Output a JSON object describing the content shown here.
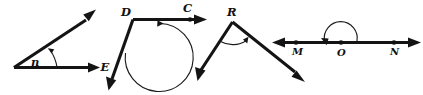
{
  "figure": {
    "background_color": "#ffffff",
    "ink_color": "#141414",
    "width": 423,
    "height": 95
  },
  "diagrams": [
    {
      "id": "angle-n",
      "vertex_label": "n",
      "endpoint_label": "E",
      "arc_direction": "counterclockwise-to-upper-ray",
      "rays": 2
    },
    {
      "id": "angle-d",
      "vertex_label": "D",
      "endpoint_label": "C",
      "arc_direction": "counterclockwise-to-horizontal-ray",
      "rays": 2
    },
    {
      "id": "angle-r",
      "vertex_label": "R",
      "arc_direction": "counterclockwise-to-right-ray",
      "rays": 2
    },
    {
      "id": "angle-mon",
      "point_labels": [
        "M",
        "O",
        "N"
      ],
      "arc_direction": "clockwise-over-line-to-left",
      "rays": 2
    }
  ],
  "labels": {
    "n": "n",
    "E": "E",
    "D": "D",
    "C": "C",
    "R": "R",
    "M": "M",
    "O": "O",
    "N": "N"
  }
}
